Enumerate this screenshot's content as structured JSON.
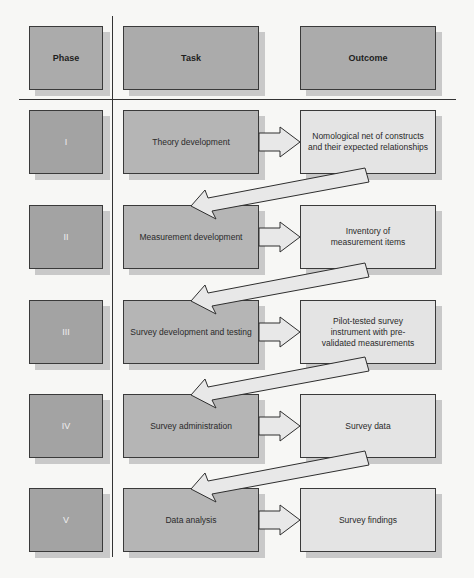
{
  "headers": {
    "phase": "Phase",
    "task": "Task",
    "outcome": "Outcome"
  },
  "rows": [
    {
      "phase": "I",
      "task": "Theory development",
      "outcome": "Nomological net of constructs and their expected relationships"
    },
    {
      "phase": "II",
      "task": "Measurement development",
      "outcome": "Inventory of measurement items"
    },
    {
      "phase": "III",
      "task": "Survey development and testing",
      "outcome": "Pilot-tested survey instrument with pre-validated measurements"
    },
    {
      "phase": "IV",
      "task": "Survey administration",
      "outcome": "Survey data"
    },
    {
      "phase": "V",
      "task": "Data analysis",
      "outcome": "Survey findings"
    }
  ],
  "colors": {
    "header_fill": "#ababab",
    "phase_fill": "#a3a3a3",
    "task_fill": "#b5b5b5",
    "outcome_fill": "#e4e4e4",
    "arrow_fill": "#e8e8e8",
    "border": "#3a3a3a"
  }
}
